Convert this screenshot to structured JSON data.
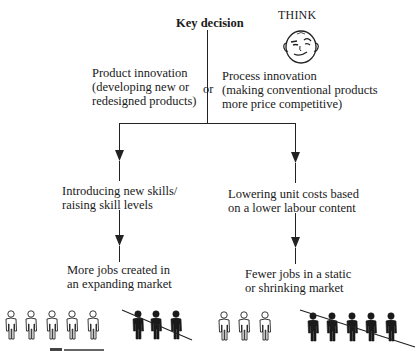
{
  "diagram": {
    "key_decision": "Key decision",
    "think_label": "THINK",
    "or_label": "or",
    "left_option": {
      "line1": "Product innovation",
      "line2": "(developing new or",
      "line3": "redesigned products)"
    },
    "right_option": {
      "line1": "Process innovation",
      "line2": "(making conventional products",
      "line3": "more price competitive)"
    },
    "left_step": {
      "line1": "Introducing new skills/",
      "line2": "raising skill levels"
    },
    "right_step": {
      "line1": "Lowering unit costs based",
      "line2": "on a lower labour content"
    },
    "left_outcome": {
      "line1": "More jobs created in",
      "line2": "an expanding market"
    },
    "right_outcome": {
      "line1": "Fewer jobs in a static",
      "line2": "or shrinking market"
    },
    "left_people": {
      "white_count": 5,
      "black_crossed_count": 3
    },
    "right_people": {
      "white_count": 3,
      "black_crossed_count": 5
    },
    "colors": {
      "line": "#222222",
      "figure_fill_dark": "#1a1a1a",
      "figure_fill_light": "#ffffff"
    }
  }
}
